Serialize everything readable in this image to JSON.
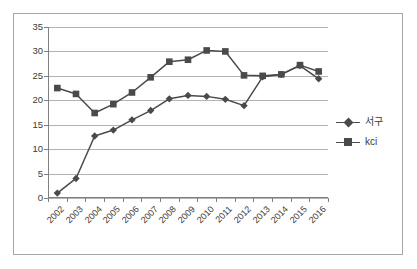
{
  "chart_data": {
    "type": "line",
    "title": "",
    "subtitle": "",
    "xlabel": "",
    "ylabel": "",
    "categories": [
      "2002",
      "2003",
      "2004",
      "2005",
      "2006",
      "2007",
      "2008",
      "2009",
      "2010",
      "2011",
      "2012",
      "2013",
      "2014",
      "2015",
      "2016"
    ],
    "series": [
      {
        "name": "서구",
        "marker": "diamond",
        "color": "#4a4a4a",
        "values": [
          1.0,
          4.0,
          12.7,
          13.9,
          16.0,
          17.9,
          20.3,
          21.0,
          20.8,
          20.2,
          18.9,
          24.8,
          25.3,
          27.1,
          24.4
        ]
      },
      {
        "name": "kci",
        "marker": "square",
        "color": "#4a4a4a",
        "values": [
          22.5,
          21.3,
          17.4,
          19.2,
          21.6,
          24.7,
          27.9,
          28.3,
          30.2,
          30.0,
          25.1,
          25.0,
          25.3,
          27.2,
          25.9
        ]
      }
    ],
    "ylim": [
      0,
      35
    ],
    "ytick_step": 5,
    "yticks": [
      "35",
      "30",
      "25",
      "20",
      "15",
      "10",
      "5",
      "0"
    ],
    "grid": true,
    "grid_axis": "y",
    "legend_position": "right",
    "legend": [
      {
        "label": "서구",
        "marker": "diamond"
      },
      {
        "label": "kci",
        "marker": "square"
      }
    ]
  },
  "colors": {
    "series_line": "#4a4a4a",
    "gridline": "#b3b3b3",
    "axis": "#808080",
    "frame": "#a6a6a6",
    "text": "#3b3b3b",
    "background": "#ffffff"
  }
}
